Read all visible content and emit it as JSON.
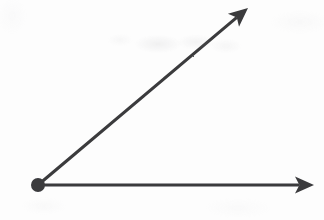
{
  "figure": {
    "kind": "geometry-angle-diagram",
    "background_color": "#fdfdfd",
    "ink_color": "#3b3b3d",
    "canvas": {
      "width": 324,
      "height": 220
    },
    "stroke_width": 3,
    "labels": [],
    "annotations": [],
    "vertex": {
      "name": "vertex-point",
      "x": 38,
      "y": 185,
      "radius": 7,
      "fill": "#3b3b3d",
      "label": ""
    },
    "rays": [
      {
        "name": "horizontal-ray",
        "from_x": 38,
        "from_y": 185,
        "to_x": 314,
        "to_y": 185,
        "angle_degrees": 0,
        "length": 276,
        "arrowhead": "solid-swept-back",
        "label": ""
      },
      {
        "name": "diagonal-ray",
        "from_x": 38,
        "from_y": 185,
        "to_x": 248,
        "to_y": 8,
        "angle_degrees": 40,
        "length": 274,
        "arrowhead": "solid-swept-back",
        "label": ""
      }
    ],
    "angle": {
      "name": "included-angle",
      "degrees": 40,
      "measure_label": "",
      "arc_shown": false
    }
  },
  "chart_data": {
    "type": "scatter",
    "xlabel": "",
    "ylabel": "",
    "xlim": [
      0,
      324
    ],
    "ylim": [
      0,
      220
    ],
    "grid": false,
    "legend": "none",
    "series": [
      {
        "name": "horizontal-ray",
        "x": [
          38,
          314
        ],
        "y": [
          185,
          185
        ]
      },
      {
        "name": "diagonal-ray",
        "x": [
          38,
          248
        ],
        "y": [
          185,
          8
        ]
      }
    ],
    "annotations": [
      {
        "name": "vertex-point",
        "x": 38,
        "y": 185,
        "text": ""
      }
    ]
  }
}
